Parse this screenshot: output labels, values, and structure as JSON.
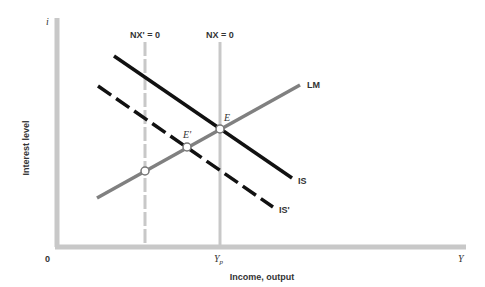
{
  "diagram": {
    "type": "IS-LM with net exports",
    "y_axis": {
      "symbol": "i",
      "label": "Interest level"
    },
    "x_axis": {
      "origin": "0",
      "symbol": "Y",
      "label": "Income, output",
      "tick_label": "Y",
      "tick_subscript": "p"
    },
    "curves": {
      "LM": "LM",
      "IS": "IS",
      "IS_prime": "IS'"
    },
    "vertical_lines": {
      "nx_prime": "NX' = 0",
      "nx": "NX = 0"
    },
    "points": {
      "E": "E",
      "E_prime": "E'"
    },
    "colors": {
      "axis": "#c8c8c8",
      "lm": "#808080",
      "is": "#111111",
      "vertical": "#c8c8c8",
      "text": "#333333"
    }
  }
}
